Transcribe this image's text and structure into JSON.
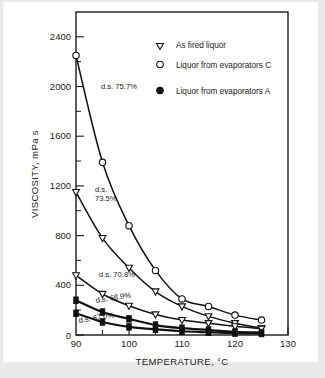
{
  "chart_data": {
    "type": "line",
    "title": "",
    "xlabel": "TEMPERATURE, °C",
    "ylabel": "VISCOSITY, mPa s",
    "xlim": [
      90,
      130
    ],
    "ylim": [
      0,
      2600
    ],
    "xticks": [
      90,
      100,
      110,
      120,
      130
    ],
    "xticks_minor": [
      95,
      105,
      115,
      125
    ],
    "yticks": [
      0,
      400,
      800,
      1200,
      1600,
      2000,
      2400
    ],
    "grid": false,
    "legend_position": "top-right",
    "legend": [
      {
        "marker": "open-triangle-down",
        "label": "As fired liquor"
      },
      {
        "marker": "open-circle",
        "label": "Liquor from evaporators C"
      },
      {
        "marker": "filled-circle",
        "label": "Liquor from evaporators A"
      }
    ],
    "annotations": [
      {
        "text": "d.s. 75.7%",
        "x": 95.5,
        "y": 1960
      },
      {
        "text": "d.s.",
        "x": 93.6,
        "y": 1130
      },
      {
        "text": "73.5%",
        "x": 93.6,
        "y": 1010
      },
      {
        "text": "d.s. 70.8%",
        "x": 95.0,
        "y": 470
      },
      {
        "text": "d.s. 68.9%",
        "x": 94.2,
        "y": 250
      },
      {
        "text": "d.s. 67.0%",
        "x": 92.6,
        "y": 110
      }
    ],
    "series": [
      {
        "name": "d.s. 75.7%",
        "marker": "open-circle",
        "legend_ref": "Liquor from evaporators C",
        "x": [
          90,
          95,
          100,
          105,
          110,
          115,
          120,
          125
        ],
        "values": [
          2250,
          1390,
          880,
          520,
          290,
          230,
          160,
          120
        ]
      },
      {
        "name": "d.s. 73.5%",
        "marker": "open-triangle-down",
        "legend_ref": "As fired liquor",
        "x": [
          90,
          95,
          100,
          105,
          110,
          115,
          120,
          125
        ],
        "values": [
          1150,
          780,
          540,
          350,
          230,
          150,
          95,
          55
        ]
      },
      {
        "name": "d.s. 70.8%",
        "marker": "open-triangle-down",
        "legend_ref": "As fired liquor",
        "x": [
          90,
          95,
          100,
          105,
          110,
          115,
          120,
          125
        ],
        "values": [
          480,
          330,
          235,
          165,
          120,
          95,
          70,
          50
        ]
      },
      {
        "name": "d.s. 68.9%",
        "marker": "filled-circle",
        "legend_ref": "Liquor from evaporators A",
        "x": [
          90,
          95,
          100,
          105,
          110,
          115,
          120,
          125
        ],
        "values": [
          280,
          185,
          130,
          80,
          55,
          40,
          25,
          20
        ]
      },
      {
        "name": "d.s. 67.0%",
        "marker": "filled-circle",
        "legend_ref": "Liquor from evaporators A",
        "x": [
          90,
          95,
          100,
          105,
          110,
          115,
          120,
          125
        ],
        "values": [
          175,
          105,
          65,
          45,
          30,
          22,
          15,
          12
        ]
      }
    ]
  },
  "labels": {
    "y_2400": "2400",
    "y_2000": "2000",
    "y_1600": "1600",
    "y_1200": "1200",
    "y_800": "800",
    "y_400": "400",
    "y_0": "0",
    "x_90": "90",
    "x_100": "100",
    "x_110": "110",
    "x_120": "120",
    "x_130": "130",
    "x_axis_title": "TEMPERATURE, °C",
    "y_axis_title": "VISCOSITY, mPa s",
    "legend_0": "As fired liquor",
    "legend_1": "Liquor from evaporators C",
    "legend_2": "Liquor from evaporators A",
    "ann_757": "d.s. 75.7%",
    "ann_735_a": "d.s.",
    "ann_735_b": "73.5%",
    "ann_708": "d.s. 70.8%",
    "ann_689": "d.s. 68.9%",
    "ann_670": "d.s. 67.0%"
  },
  "colors": {
    "ink": "#111111",
    "background": "#ffffff",
    "page_border": "#e9e9e9"
  }
}
